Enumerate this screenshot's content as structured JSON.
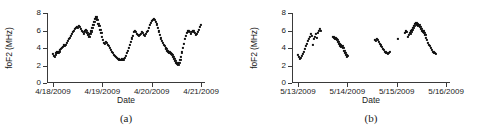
{
  "figure": {
    "panels": [
      {
        "caption": "(a)",
        "ylabel": "foF2 (MHz)",
        "xlabel": "Date",
        "yticks": [
          "0",
          "2",
          "4",
          "6",
          "8"
        ],
        "xticks": [
          "4/18/2009",
          "4/19/2009",
          "4/20/2009",
          "4/21/2009"
        ]
      },
      {
        "caption": "(b)",
        "ylabel": "foF2 (MHz)",
        "xlabel": "Date",
        "yticks": [
          "0",
          "2",
          "4",
          "6",
          "8"
        ],
        "xticks": [
          "5/13/2009",
          "5/14/2009",
          "5/15/2009",
          "5/16/2009"
        ]
      }
    ]
  },
  "chart_data": [
    {
      "type": "scatter",
      "title": "(a)",
      "xlabel": "Date",
      "ylabel": "foF2 (MHz)",
      "xtick_labels": [
        "4/18/2009",
        "4/19/2009",
        "4/20/2009",
        "4/21/2009"
      ],
      "xtick_positions": [
        0,
        1,
        2,
        3
      ],
      "ytick_labels": [
        "0",
        "2",
        "4",
        "6",
        "8"
      ],
      "ylim": [
        0,
        8
      ],
      "xlim": [
        -0.12,
        3.08
      ],
      "grid": false,
      "legend": null,
      "marker": "square",
      "color": "#111111",
      "series": [
        {
          "name": "foF2",
          "x": [
            0.0,
            0.02,
            0.04,
            0.06,
            0.07,
            0.09,
            0.11,
            0.13,
            0.14,
            0.16,
            0.18,
            0.2,
            0.22,
            0.24,
            0.26,
            0.28,
            0.3,
            0.32,
            0.34,
            0.36,
            0.38,
            0.4,
            0.42,
            0.44,
            0.46,
            0.48,
            0.5,
            0.52,
            0.54,
            0.56,
            0.58,
            0.6,
            0.62,
            0.64,
            0.66,
            0.68,
            0.7,
            0.72,
            0.74,
            0.76,
            0.78,
            0.8,
            0.82,
            0.84,
            0.86,
            0.88,
            0.9,
            0.92,
            0.94,
            0.96,
            0.98,
            1.0,
            1.02,
            1.04,
            1.06,
            1.08,
            1.1,
            1.12,
            1.14,
            1.16,
            1.18,
            1.2,
            1.22,
            1.24,
            1.26,
            1.28,
            1.3,
            1.32,
            1.34,
            1.36,
            1.38,
            1.4,
            1.42,
            1.44,
            1.46,
            1.48,
            1.5,
            1.52,
            1.54,
            1.56,
            1.58,
            1.6,
            1.62,
            1.64,
            1.66,
            1.68,
            1.7,
            1.72,
            1.74,
            1.76,
            1.78,
            1.8,
            1.82,
            1.84,
            1.86,
            1.88,
            1.9,
            1.92,
            1.94,
            1.96,
            1.98,
            2.0,
            2.02,
            2.04,
            2.06,
            2.08,
            2.1,
            2.12,
            2.14,
            2.16,
            2.18,
            2.2,
            2.22,
            2.24,
            2.26,
            2.28,
            2.3,
            2.32,
            2.34,
            2.36,
            2.38,
            2.4,
            2.42,
            2.44,
            2.46,
            2.48,
            2.5,
            2.52,
            2.54,
            2.56,
            2.58,
            2.6,
            2.62,
            2.64,
            2.66,
            2.68,
            2.7,
            2.72,
            2.74,
            2.76,
            2.78,
            2.8,
            2.82,
            2.84,
            2.86,
            2.88,
            2.9,
            2.92,
            2.94,
            2.96,
            2.98,
            3.0
          ],
          "y": [
            3.3,
            3.1,
            3.0,
            3.2,
            3.4,
            3.5,
            3.4,
            3.6,
            3.8,
            3.9,
            4.0,
            4.1,
            4.3,
            4.2,
            4.4,
            4.6,
            4.8,
            5.0,
            5.2,
            5.4,
            5.6,
            5.8,
            6.0,
            6.2,
            6.3,
            6.4,
            6.3,
            6.5,
            6.4,
            6.2,
            6.0,
            5.8,
            5.6,
            5.9,
            6.1,
            6.0,
            5.7,
            5.5,
            5.3,
            5.6,
            5.9,
            6.3,
            6.6,
            7.0,
            7.3,
            7.5,
            7.2,
            6.8,
            6.5,
            6.1,
            5.7,
            5.3,
            4.9,
            4.6,
            4.5,
            4.7,
            4.6,
            4.4,
            4.2,
            4.0,
            3.8,
            3.6,
            3.4,
            3.2,
            3.1,
            3.0,
            2.9,
            2.8,
            2.7,
            2.6,
            2.6,
            2.7,
            2.6,
            2.7,
            2.9,
            3.1,
            3.4,
            3.7,
            4.0,
            4.4,
            4.7,
            5.1,
            5.4,
            5.8,
            6.0,
            5.8,
            5.6,
            5.5,
            5.4,
            5.5,
            5.6,
            5.8,
            5.7,
            5.5,
            5.4,
            5.6,
            5.8,
            6.0,
            6.3,
            6.6,
            6.9,
            7.1,
            7.2,
            7.3,
            7.2,
            7.0,
            6.7,
            6.3,
            5.9,
            5.5,
            5.1,
            4.8,
            4.6,
            4.4,
            4.2,
            4.0,
            3.9,
            3.7,
            3.6,
            3.5,
            3.4,
            3.3,
            3.2,
            3.0,
            2.8,
            2.5,
            2.3,
            2.2,
            2.1,
            2.3,
            2.6,
            3.0,
            3.5,
            4.0,
            4.5,
            5.0,
            5.4,
            5.7,
            5.9,
            6.0,
            5.8,
            5.6,
            5.8,
            6.0,
            5.9,
            5.7,
            5.5,
            5.6,
            5.8,
            6.1,
            6.4,
            6.6
          ]
        }
      ]
    },
    {
      "type": "scatter",
      "title": "(b)",
      "xlabel": "Date",
      "ylabel": "foF2 (MHz)",
      "xtick_labels": [
        "5/13/2009",
        "5/14/2009",
        "5/15/2009",
        "5/16/2009"
      ],
      "xtick_positions": [
        0,
        1,
        2,
        3
      ],
      "ytick_labels": [
        "0",
        "2",
        "4",
        "6",
        "8"
      ],
      "ylim": [
        0,
        8
      ],
      "xlim": [
        -0.12,
        3.08
      ],
      "grid": false,
      "legend": null,
      "marker": "square",
      "color": "#111111",
      "note": "data has gaps; four disjoint segments",
      "series": [
        {
          "name": "foF2",
          "x": [
            0.0,
            0.02,
            0.04,
            0.06,
            0.08,
            0.1,
            0.12,
            0.14,
            0.16,
            0.18,
            0.2,
            0.22,
            0.24,
            0.26,
            0.28,
            0.3,
            0.32,
            0.34,
            0.36,
            0.38,
            0.4,
            0.42,
            0.44,
            0.46,
            0.72,
            0.74,
            0.76,
            0.78,
            0.8,
            0.82,
            0.84,
            0.86,
            0.88,
            0.9,
            0.92,
            0.94,
            0.96,
            0.98,
            1.0,
            1.02,
            1.56,
            1.58,
            1.6,
            1.62,
            1.64,
            1.66,
            1.68,
            1.7,
            1.72,
            1.74,
            1.76,
            1.78,
            1.8,
            1.82,
            1.84,
            1.86,
            2.02,
            2.16,
            2.18,
            2.2,
            2.22,
            2.24,
            2.26,
            2.28,
            2.3,
            2.32,
            2.34,
            2.36,
            2.38,
            2.4,
            2.42,
            2.44,
            2.46,
            2.48,
            2.5,
            2.52,
            2.54,
            2.56,
            2.58,
            2.6,
            2.62,
            2.64,
            2.66,
            2.68,
            2.7,
            2.72,
            2.74,
            2.76,
            2.78,
            2.8
          ],
          "y": [
            3.2,
            3.0,
            2.8,
            2.9,
            3.1,
            3.3,
            3.6,
            3.9,
            4.2,
            4.5,
            4.8,
            5.0,
            5.3,
            5.6,
            5.4,
            4.4,
            5.0,
            5.3,
            5.6,
            5.2,
            5.7,
            6.0,
            6.2,
            6.0,
            5.3,
            5.2,
            5.1,
            5.0,
            4.9,
            4.7,
            4.5,
            4.3,
            4.1,
            4.2,
            4.0,
            3.7,
            3.4,
            3.2,
            3.0,
            3.1,
            4.9,
            4.8,
            5.0,
            4.9,
            4.7,
            4.5,
            4.3,
            4.1,
            3.9,
            3.8,
            3.6,
            3.5,
            3.4,
            3.3,
            3.4,
            3.6,
            5.0,
            5.7,
            5.9,
            5.8,
            5.3,
            5.5,
            5.7,
            5.6,
            5.9,
            6.1,
            6.3,
            6.5,
            6.8,
            6.9,
            6.7,
            6.5,
            6.6,
            6.4,
            6.2,
            6.0,
            5.9,
            5.7,
            5.5,
            5.2,
            4.9,
            4.6,
            4.4,
            4.2,
            4.0,
            3.8,
            3.6,
            3.5,
            3.4,
            3.3
          ]
        }
      ]
    }
  ]
}
